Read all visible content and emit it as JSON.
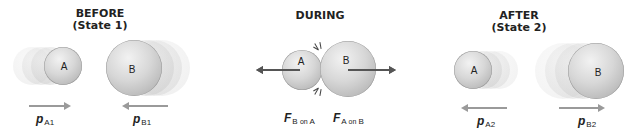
{
  "panels": {
    "before": {
      "title_line1": "BEFORE",
      "title_line2": "(State 1)",
      "ball_a": {
        "label": "A",
        "motion": "right"
      },
      "ball_b": {
        "label": "B",
        "motion": "left"
      },
      "momentum_a": {
        "symbol": "p",
        "subscript": "A1",
        "direction": "right"
      },
      "momentum_b": {
        "symbol": "p",
        "subscript": "B1",
        "direction": "left"
      }
    },
    "during": {
      "title": "DURING",
      "ball_a": {
        "label": "A"
      },
      "ball_b": {
        "label": "B"
      },
      "force_on_a": {
        "symbol": "F",
        "subscript_main": "B",
        "subscript_on": "on",
        "subscript_target": "A",
        "direction": "left"
      },
      "force_on_b": {
        "symbol": "F",
        "subscript_main": "A",
        "subscript_on": "on",
        "subscript_target": "B",
        "direction": "right"
      }
    },
    "after": {
      "title_line1": "AFTER",
      "title_line2": "(State 2)",
      "ball_a": {
        "label": "A",
        "motion": "left"
      },
      "ball_b": {
        "label": "B",
        "motion": "right"
      },
      "momentum_a": {
        "symbol": "p",
        "subscript": "A2",
        "direction": "left"
      },
      "momentum_b": {
        "symbol": "p",
        "subscript": "B2",
        "direction": "right"
      }
    }
  },
  "colors": {
    "sphere": "#d0d0d0",
    "momentum_arrow": "#9a9a9a",
    "force_arrow": "#555555",
    "text": "#222222"
  }
}
